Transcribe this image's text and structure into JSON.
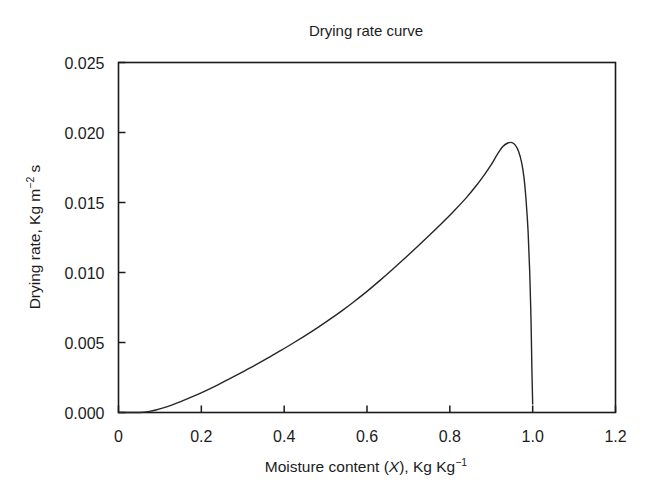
{
  "chart_data": {
    "type": "line",
    "title": "Drying rate curve",
    "xlabel": "Moisture content (X), Kg Kg",
    "xlabel_plain": "Moisture content (X), Kg Kg^-1",
    "xlabel_prefix": "Moisture content (",
    "xlabel_var": "X",
    "xlabel_mid": "), Kg Kg",
    "xlabel_exp": "−1",
    "ylabel_plain": "Drying rate, Kg m^-2 s",
    "ylabel_prefix": "Drying rate, Kg m",
    "ylabel_exp": "−2",
    "ylabel_suffix": " s",
    "xlim": [
      0,
      1.2
    ],
    "ylim": [
      0,
      0.025
    ],
    "xticks": [
      "0",
      "0.2",
      "0.4",
      "0.6",
      "0.8",
      "1.0",
      "1.2"
    ],
    "xtick_values": [
      0,
      0.2,
      0.4,
      0.6,
      0.8,
      1.0,
      1.2
    ],
    "yticks": [
      "0.000",
      "0.005",
      "0.010",
      "0.015",
      "0.020",
      "0.025"
    ],
    "ytick_values": [
      0.0,
      0.005,
      0.01,
      0.015,
      0.02,
      0.025
    ],
    "grid": false,
    "legend": false,
    "line_color": "#262626",
    "line_width": 1.4,
    "background": "#ffffff",
    "frame_color": "#1a1a1a",
    "series": [
      {
        "name": "Drying rate",
        "x": [
          0.0,
          0.04,
          0.06,
          0.075,
          0.09,
          0.11,
          0.13,
          0.15,
          0.18,
          0.21,
          0.24,
          0.27,
          0.3,
          0.33,
          0.36,
          0.39,
          0.42,
          0.45,
          0.48,
          0.51,
          0.54,
          0.57,
          0.6,
          0.63,
          0.66,
          0.69,
          0.72,
          0.75,
          0.78,
          0.81,
          0.84,
          0.865,
          0.885,
          0.9,
          0.915,
          0.928,
          0.94,
          0.95,
          0.958,
          0.966,
          0.973,
          0.979,
          0.984,
          0.989,
          0.993,
          0.996,
          0.998,
          1.0
        ],
        "y": [
          0.0,
          0.0,
          2e-05,
          8e-05,
          0.00018,
          0.00035,
          0.00055,
          0.00078,
          0.00115,
          0.00155,
          0.00198,
          0.00243,
          0.0029,
          0.00338,
          0.00388,
          0.0044,
          0.00493,
          0.00548,
          0.00605,
          0.00665,
          0.00728,
          0.00795,
          0.00865,
          0.0094,
          0.01018,
          0.01098,
          0.0118,
          0.01264,
          0.0135,
          0.0144,
          0.01535,
          0.01625,
          0.01705,
          0.0177,
          0.01845,
          0.019,
          0.01925,
          0.01928,
          0.0191,
          0.01865,
          0.0179,
          0.0168,
          0.0152,
          0.0129,
          0.0099,
          0.0066,
          0.0033,
          0.0006
        ]
      }
    ],
    "annotations": {
      "peak_x": 0.93,
      "peak_y": 0.0193,
      "onset_x": 0.06,
      "end_x": 1.0,
      "end_y": 0.0006
    }
  }
}
